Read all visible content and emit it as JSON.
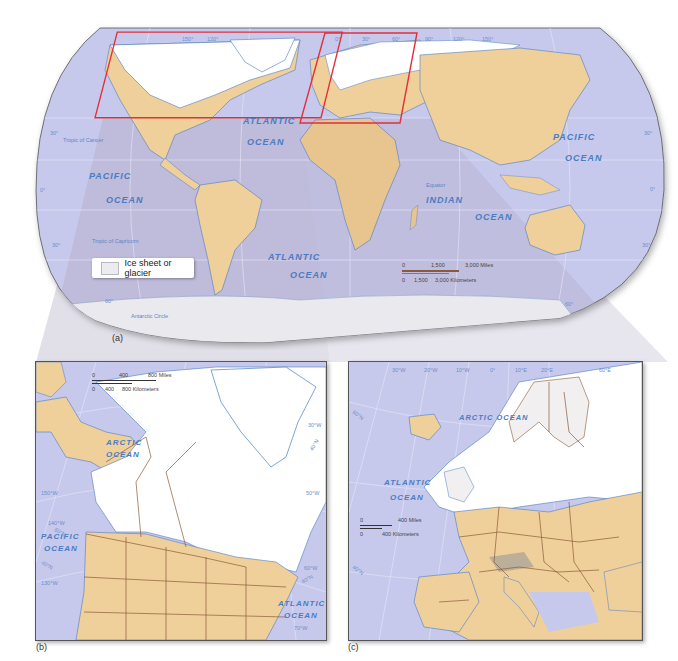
{
  "figure": {
    "panels": [
      {
        "id": "a",
        "tag": "(a)",
        "title": "World map showing ice sheets and glaciers"
      },
      {
        "id": "b",
        "tag": "(b)",
        "title": "North America detail"
      },
      {
        "id": "c",
        "tag": "(c)",
        "title": "Europe detail"
      }
    ],
    "colors": {
      "ocean": "#c7c9ec",
      "ocean_shaded": "#b9b3cf",
      "land": "#f0d09a",
      "ice": "#ffffff",
      "water_lines": "#4a7cc4",
      "borders": "#8b5a3c",
      "highlight_box": "#e0313a",
      "connector": "#d9d9dc"
    }
  },
  "world_map": {
    "ocean_labels": {
      "atlantic_north": [
        "ATLANTIC",
        "OCEAN"
      ],
      "pacific_west": [
        "PACIFIC",
        "OCEAN"
      ],
      "pacific_east": [
        "PACIFIC",
        "OCEAN"
      ],
      "atlantic_south": [
        "ATLANTIC",
        "OCEAN"
      ],
      "indian": [
        "INDIAN",
        "OCEAN"
      ]
    },
    "lines": {
      "tropic_cancer": "Tropic of Cancer",
      "tropic_capricorn": "Tropic of Capricorn",
      "antarctic_circle": "Antarctic Circle",
      "equator": "Equator"
    },
    "longitude_labels": [
      "150°",
      "120°",
      "0°",
      "30°",
      "60°",
      "90°",
      "120°",
      "150°"
    ],
    "latitude_labels_left": [
      "30°",
      "0°",
      "30°",
      "60°"
    ],
    "latitude_labels_right": [
      "30°",
      "0°",
      "30°",
      "60°"
    ],
    "legend": {
      "swatch": "ice-sheet",
      "label": "Ice sheet or glacier"
    },
    "scale": {
      "miles": [
        "0",
        "1,500",
        "3,000 Miles"
      ],
      "km": [
        "0",
        "1,500",
        "3,000 Kilometers"
      ]
    }
  },
  "north_america_map": {
    "ocean_labels": {
      "arctic": [
        "ARCTIC",
        "OCEAN"
      ],
      "pacific": [
        "PACIFIC",
        "OCEAN"
      ],
      "atlantic": [
        "ATLANTIC",
        "OCEAN"
      ]
    },
    "grid_labels": [
      "150°W",
      "140°W",
      "50°N",
      "40°N",
      "130°W",
      "30°W",
      "40°N",
      "50°W",
      "60°W",
      "40°N",
      "70°W"
    ],
    "scale": {
      "miles": [
        "0",
        "400",
        "800 Miles"
      ],
      "km": [
        "0",
        "400",
        "800 Kilometers"
      ]
    }
  },
  "europe_map": {
    "ocean_labels": {
      "arctic": "ARCTIC OCEAN",
      "atlantic": [
        "ATLANTIC",
        "OCEAN"
      ]
    },
    "grid_labels_top": [
      "30°W",
      "20°W",
      "10°W",
      "0°",
      "10°E",
      "20°E",
      "60°E"
    ],
    "grid_labels_left": [
      "60°N",
      "40°N"
    ],
    "scale": {
      "miles": [
        "0",
        "400 Miles"
      ],
      "km": [
        "0",
        "400 Kilometers"
      ]
    }
  }
}
